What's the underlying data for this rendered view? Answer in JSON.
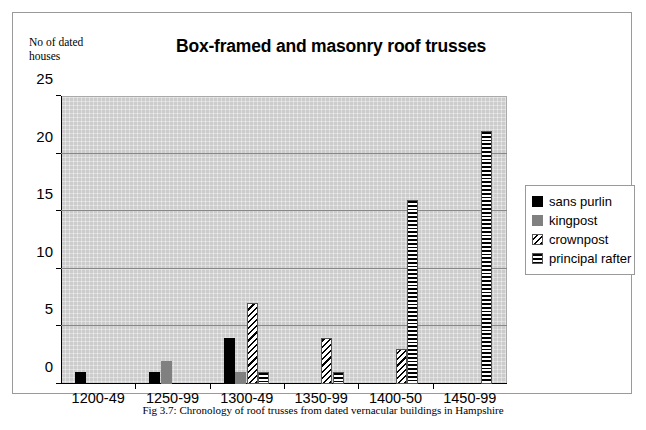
{
  "figure": {
    "caption": "Fig 3.7: Chronology of roof trusses from dated vernacular buildings in Hampshire"
  },
  "chart_data": {
    "type": "bar",
    "title": "Box-framed and masonry roof trusses",
    "subtitle": "",
    "xlabel": "",
    "ylabel": "No of dated\nhouses",
    "categories": [
      "1200-49",
      "1250-99",
      "1300-49",
      "1350-99",
      "1400-50",
      "1450-99"
    ],
    "series": [
      {
        "name": "sans purlin",
        "color": "#000000",
        "pattern": "solid",
        "values": [
          1,
          1,
          4,
          0,
          0,
          0
        ]
      },
      {
        "name": "kingpost",
        "color": "#808080",
        "pattern": "solid",
        "values": [
          0,
          2,
          1,
          0,
          0,
          0
        ]
      },
      {
        "name": "crownpost",
        "color": "#000000",
        "pattern": "diagonal",
        "values": [
          0,
          0,
          7,
          4,
          3,
          0
        ]
      },
      {
        "name": "principal rafter",
        "color": "#000000",
        "pattern": "horizontal",
        "values": [
          0,
          0,
          1,
          1,
          16,
          22
        ]
      }
    ],
    "ylim": [
      0,
      25
    ],
    "yticks": [
      0,
      5,
      10,
      15,
      20,
      25
    ],
    "grid": true,
    "legend_position": "right",
    "plot_background": "#cccccc"
  }
}
